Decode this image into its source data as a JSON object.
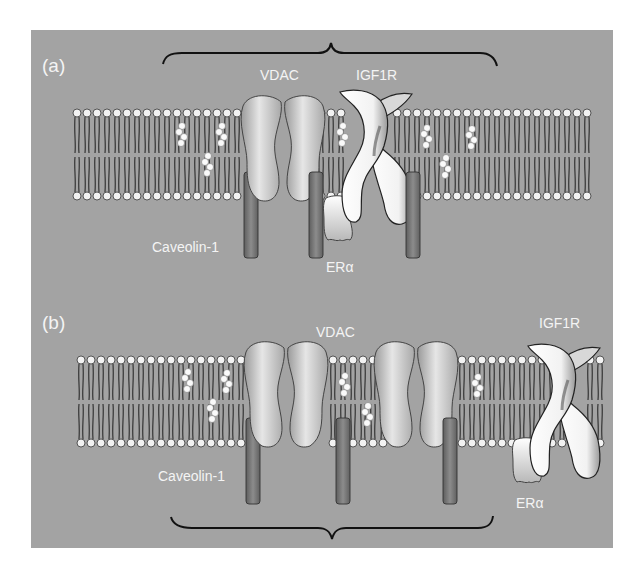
{
  "figure": {
    "background_color": "#a3a3a3",
    "membrane_head_color": "#f2f2f2",
    "tail_color": "#2a2a2a",
    "vdac_color": "#c2c2c2",
    "caveolin_color": "#7a7a7a",
    "igf1r_color": "#f8f8f8",
    "bracket_color": "#111111"
  },
  "panel_a": {
    "label": "(a)",
    "proteins": {
      "vdac": "VDAC",
      "igf1r": "IGF1R",
      "caveolin": "Caveolin-1",
      "er_alpha": "ERα"
    }
  },
  "panel_b": {
    "label": "(b)",
    "proteins": {
      "vdac": "VDAC",
      "igf1r": "IGF1R",
      "caveolin": "Caveolin-1",
      "er_alpha": "ERα"
    }
  }
}
